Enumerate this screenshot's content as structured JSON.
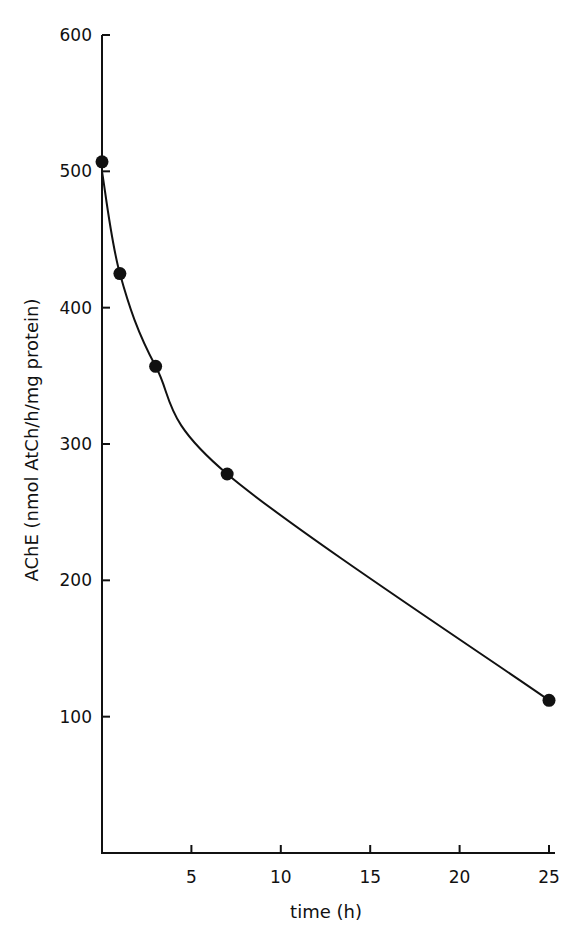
{
  "chart_data": {
    "type": "line",
    "title": "",
    "xlabel": "time (h)",
    "ylabel": "AChE  (nmol AtCh/h/mg protein)",
    "xlim": [
      0,
      25
    ],
    "ylim": [
      0,
      600
    ],
    "x_ticks": [
      5,
      10,
      15,
      20,
      25
    ],
    "y_ticks": [
      100,
      200,
      300,
      400,
      500,
      600
    ],
    "grid": false,
    "legend": null,
    "series": [
      {
        "name": "AChE activity",
        "marker": "filled-circle",
        "x": [
          0,
          1,
          3,
          7,
          25
        ],
        "values": [
          507,
          425,
          357,
          278,
          112
        ]
      }
    ],
    "fit_curve": "smooth exponential-type decay through points"
  },
  "axes": {
    "x_title": "time (h)",
    "y_title": "AChE  (nmol AtCh/h/mg protein)",
    "x_tick_labels": [
      "5",
      "10",
      "15",
      "20",
      "25"
    ],
    "y_tick_labels": [
      "100",
      "200",
      "300",
      "400",
      "500",
      "600"
    ]
  },
  "colors": {
    "ink": "#111111",
    "background": "#ffffff"
  }
}
